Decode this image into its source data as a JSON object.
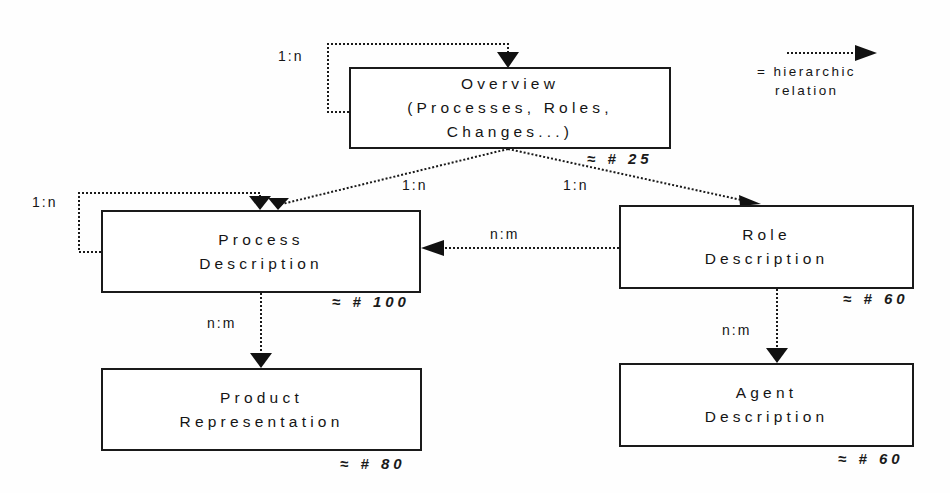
{
  "diagram": {
    "legend": {
      "symbol": "dotted-arrow",
      "line1": "= hierarchic",
      "line2": "relation"
    },
    "nodes": {
      "overview": {
        "lines": [
          "Overview",
          "(Processes, Roles,",
          "Changes...)"
        ],
        "count": "≈ # 25",
        "self_relation": "1:n"
      },
      "process": {
        "lines": [
          "Process",
          "Description"
        ],
        "count": "≈ # 100",
        "self_relation": "1:n"
      },
      "role": {
        "lines": [
          "Role",
          "Description"
        ],
        "count": "≈ # 60"
      },
      "product": {
        "lines": [
          "Product",
          "Representation"
        ],
        "count": "≈ # 80"
      },
      "agent": {
        "lines": [
          "Agent",
          "Description"
        ],
        "count": "≈ # 60"
      }
    },
    "edges": {
      "overview_to_process": "1:n",
      "overview_to_role": "1:n",
      "role_to_process": "n:m",
      "process_to_product": "n:m",
      "role_to_agent": "n:m"
    },
    "colors": {
      "line": "#1a1a1a",
      "background": "#fefefe"
    }
  }
}
